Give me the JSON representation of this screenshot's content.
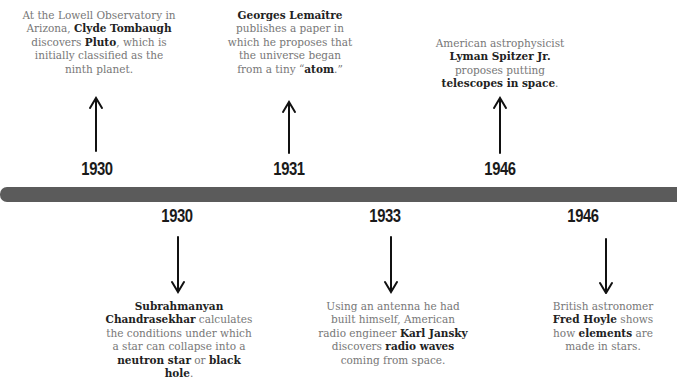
{
  "timeline": {
    "bar_color": "#5b5b5b",
    "above": [
      {
        "year": "1930",
        "parts": [
          {
            "t": "At the Lowell Observatory in Arizona, ",
            "b": false
          },
          {
            "t": "Clyde Tombaugh",
            "b": true
          },
          {
            "t": " discovers ",
            "b": false
          },
          {
            "t": "Pluto",
            "b": true
          },
          {
            "t": ", which is initially classified as the ninth planet.",
            "b": false
          }
        ]
      },
      {
        "year": "1931",
        "parts": [
          {
            "t": "Georges Lemaître",
            "b": true
          },
          {
            "t": " publishes a paper in which he proposes that the universe began from a tiny “",
            "b": false
          },
          {
            "t": "atom",
            "b": true
          },
          {
            "t": ".”",
            "b": false
          }
        ]
      },
      {
        "year": "1946",
        "parts": [
          {
            "t": "American astrophysicist ",
            "b": false
          },
          {
            "t": "Lyman Spitzer Jr.",
            "b": true
          },
          {
            "t": " proposes putting ",
            "b": false
          },
          {
            "t": "telescopes in space",
            "b": true
          },
          {
            "t": ".",
            "b": false
          }
        ]
      }
    ],
    "below": [
      {
        "year": "1930",
        "parts": [
          {
            "t": "Subrahmanyan Chandrasekhar",
            "b": true
          },
          {
            "t": " calculates the conditions under which a star can collapse into a ",
            "b": false
          },
          {
            "t": "neutron star",
            "b": true
          },
          {
            "t": " or ",
            "b": false
          },
          {
            "t": "black hole",
            "b": true
          },
          {
            "t": ".",
            "b": false
          }
        ]
      },
      {
        "year": "1933",
        "parts": [
          {
            "t": "Using an antenna he had built himself, American radio engineer ",
            "b": false
          },
          {
            "t": "Karl Jansky",
            "b": true
          },
          {
            "t": " discovers ",
            "b": false
          },
          {
            "t": "radio waves",
            "b": true
          },
          {
            "t": " coming from space.",
            "b": false
          }
        ]
      },
      {
        "year": "1946",
        "parts": [
          {
            "t": "British astronomer ",
            "b": false
          },
          {
            "t": "Fred Hoyle",
            "b": true
          },
          {
            "t": " shows how ",
            "b": false
          },
          {
            "t": "elements",
            "b": true
          },
          {
            "t": " are made in stars.",
            "b": false
          }
        ]
      }
    ]
  }
}
